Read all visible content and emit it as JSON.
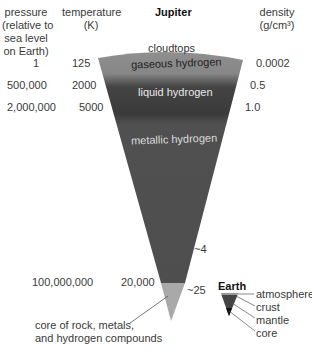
{
  "title": "Jupiter",
  "headers": {
    "pressure": [
      "pressure",
      "(relative to",
      "sea level",
      "on Earth)"
    ],
    "temperature": [
      "temperature",
      "(K)"
    ],
    "density": [
      "density",
      "(g/cm³)"
    ]
  },
  "rows": [
    {
      "pressure": "1",
      "temperature": "125",
      "density": "0.0002"
    },
    {
      "pressure": "500,000",
      "temperature": "2000",
      "density": "0.5"
    },
    {
      "pressure": "2,000,000",
      "temperature": "5000",
      "density": "1.0"
    },
    {
      "pressure": "100,000,000",
      "temperature": "20,000",
      "density": "~25"
    }
  ],
  "extra_density": "~4",
  "layers": {
    "cloudtops": "cloudtops",
    "gaseous": "gaseous hydrogen",
    "liquid": "liquid hydrogen",
    "metallic": "metallic hydrogen"
  },
  "core_label": [
    "core of rock, metals,",
    "and hydrogen compounds"
  ],
  "earth": {
    "title": "Earth",
    "layers": [
      "atmosphere",
      "crust",
      "mantle",
      "core"
    ]
  },
  "colors": {
    "gaseous": "#8a8a8a",
    "liquid": "#3e3e3e",
    "metallic": "#555555",
    "core": "#a8a8a8"
  }
}
